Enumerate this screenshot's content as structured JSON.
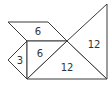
{
  "diagram": {
    "type": "tangram-area-puzzle",
    "stroke_color": "#3a3a3a",
    "background": "#ffffff",
    "pieces": [
      {
        "id": "parallelogram",
        "label": "6",
        "points": "8,22 48,22 67,41 27,41",
        "label_x": 38,
        "label_y": 31
      },
      {
        "id": "small-triangle",
        "label": "3",
        "points": "27,41 8,60 27,79",
        "label_x": 20,
        "label_y": 60
      },
      {
        "id": "medium-triangle",
        "label": "6",
        "points": "27,41 67,41 27,79",
        "label_x": 40,
        "label_y": 53
      },
      {
        "id": "large-triangle-bottom",
        "label": "12",
        "points": "67,41 27,79 107,79",
        "label_x": 67,
        "label_y": 67
      },
      {
        "id": "large-triangle-right",
        "label": "12",
        "points": "67,41 107,4 107,79",
        "label_x": 94,
        "label_y": 44
      }
    ]
  }
}
